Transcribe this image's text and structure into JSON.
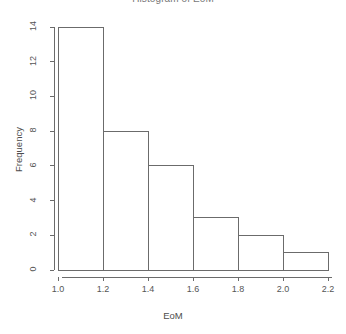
{
  "chart_data": {
    "type": "bar",
    "title": "Histogram of EoM",
    "xlabel": "EoM",
    "ylabel": "Frequency",
    "categories": [
      "1.0-1.2",
      "1.2-1.4",
      "1.4-1.6",
      "1.6-1.8",
      "1.8-2.0",
      "2.0-2.2"
    ],
    "bin_edges": [
      1.0,
      1.2,
      1.4,
      1.6,
      1.8,
      2.0,
      2.2
    ],
    "values": [
      14,
      8,
      6,
      3,
      2,
      1
    ],
    "xlim": [
      1.0,
      2.2
    ],
    "ylim": [
      0,
      14
    ],
    "xticks": [
      1.0,
      1.2,
      1.4,
      1.6,
      1.8,
      2.0,
      2.2
    ],
    "xtick_labels": [
      "1.0",
      "1.2",
      "1.4",
      "1.6",
      "1.8",
      "2.0",
      "2.2"
    ],
    "yticks": [
      0,
      2,
      4,
      6,
      8,
      10,
      12,
      14
    ],
    "ytick_labels": [
      "0",
      "2",
      "4",
      "6",
      "8",
      "10",
      "12",
      "14"
    ],
    "grid": false,
    "legend": false,
    "bar_fill_color": "#ffffff",
    "bar_border_color": "#6b6b6b",
    "axis_color": "#6b6b6b",
    "background_color": "#ffffff"
  }
}
